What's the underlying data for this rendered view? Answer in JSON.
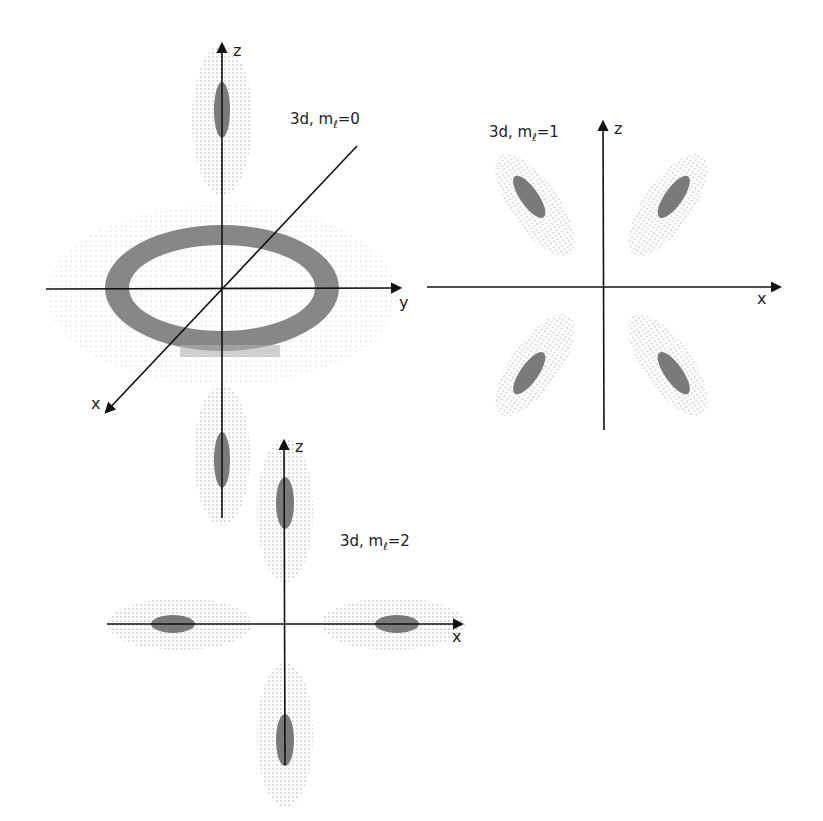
{
  "figure": {
    "background": "#ffffff",
    "ink_color": "#111111",
    "dense_color": "#6e6e6e",
    "dot_color": "#9a9a9a"
  },
  "panels": [
    {
      "id": "m0",
      "label_prefix": "3d, m",
      "label_sub": "ℓ",
      "label_suffix": "=0",
      "axes": {
        "vertical": "z",
        "horizontal": "y",
        "diagonal": "x"
      },
      "shape": "dz2 lobes along z with torus in xy-plane"
    },
    {
      "id": "m1",
      "label_prefix": "3d, m",
      "label_sub": "ℓ",
      "label_suffix": "=1",
      "axes": {
        "vertical": "z",
        "horizontal": "x"
      },
      "shape": "four lobes between axes (dxz)"
    },
    {
      "id": "m2",
      "label_prefix": "3d, m",
      "label_sub": "ℓ",
      "label_suffix": "=2",
      "axes": {
        "vertical": "z",
        "horizontal": "x"
      },
      "shape": "four lobes along axes"
    }
  ]
}
